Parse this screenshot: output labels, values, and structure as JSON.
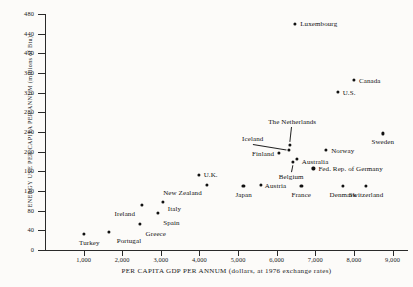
{
  "chart_data": {
    "type": "scatter",
    "title": "",
    "xlabel": "PER CAPITA GDP PER ANNUM (dollars, at 1976 exchange rates)",
    "ylabel": "ENERGY USE PER CAPITA PER ANNUM (millions of Btu)",
    "xlim": [
      0,
      9400
    ],
    "ylim": [
      0,
      480
    ],
    "xticks": [
      "1,000",
      "2,000",
      "3,000",
      "4,000",
      "5,000",
      "6,000",
      "7,000",
      "8,000",
      "9,000"
    ],
    "xtick_values": [
      1000,
      2000,
      3000,
      4000,
      5000,
      6000,
      7000,
      8000,
      9000
    ],
    "yticks": [
      "0",
      "40",
      "80",
      "120",
      "160",
      "200",
      "240",
      "280",
      "320",
      "360",
      "400",
      "440",
      "480"
    ],
    "ytick_values": [
      0,
      40,
      80,
      120,
      160,
      200,
      240,
      280,
      320,
      360,
      400,
      440,
      480
    ],
    "grid": false,
    "legend": "none",
    "points": [
      {
        "name": "Turkey",
        "x": 1000,
        "y": 33,
        "lx": 6,
        "ly": 10,
        "anchor": "center"
      },
      {
        "name": "Portugal",
        "x": 1650,
        "y": 37,
        "lx": 8,
        "ly": 10,
        "anchor": "left"
      },
      {
        "name": "Greece",
        "x": 2450,
        "y": 53,
        "lx": 6,
        "ly": 11,
        "anchor": "left"
      },
      {
        "name": "Ireland",
        "x": 2500,
        "y": 92,
        "lx": -6,
        "ly": 10,
        "anchor": "right"
      },
      {
        "name": "Spain",
        "x": 2930,
        "y": 75,
        "lx": 5,
        "ly": 11,
        "anchor": "left"
      },
      {
        "name": "Italy",
        "x": 3050,
        "y": 98,
        "lx": 5,
        "ly": 8,
        "anchor": "left"
      },
      {
        "name": "New Zealand",
        "x": 4200,
        "y": 132,
        "lx": -5,
        "ly": 9,
        "anchor": "right"
      },
      {
        "name": "U.K.",
        "x": 3980,
        "y": 152,
        "lx": 5,
        "ly": 1,
        "anchor": "left"
      },
      {
        "name": "Japan",
        "x": 5140,
        "y": 130,
        "lx": 0,
        "ly": 10,
        "anchor": "center"
      },
      {
        "name": "Austria",
        "x": 5590,
        "y": 133,
        "lx": 4,
        "ly": 2,
        "anchor": "left"
      },
      {
        "name": "Finland",
        "x": 6060,
        "y": 198,
        "lx": -5,
        "ly": 2,
        "anchor": "right"
      },
      {
        "name": "Iceland",
        "x": 6320,
        "y": 203,
        "lx": -26,
        "ly": -10,
        "anchor": "right",
        "leader": true
      },
      {
        "name": "The Netherlands",
        "x": 6350,
        "y": 213,
        "lx": 2,
        "ly": -22,
        "anchor": "center",
        "leader": true
      },
      {
        "name": "Belgium",
        "x": 6430,
        "y": 180,
        "lx": -2,
        "ly": 16,
        "anchor": "center",
        "leader": true
      },
      {
        "name": "Australia",
        "x": 6520,
        "y": 186,
        "lx": 5,
        "ly": 4,
        "anchor": "left"
      },
      {
        "name": "France",
        "x": 6640,
        "y": 130,
        "lx": 0,
        "ly": 10,
        "anchor": "center"
      },
      {
        "name": "Fed. Rep. of Germany",
        "x": 6950,
        "y": 166,
        "lx": 5,
        "ly": 2,
        "anchor": "left"
      },
      {
        "name": "Norway",
        "x": 7280,
        "y": 203,
        "lx": 5,
        "ly": 2,
        "anchor": "left"
      },
      {
        "name": "U.S.",
        "x": 7580,
        "y": 322,
        "lx": 5,
        "ly": 2,
        "anchor": "left"
      },
      {
        "name": "Denmark",
        "x": 7720,
        "y": 131,
        "lx": 0,
        "ly": 10,
        "anchor": "center"
      },
      {
        "name": "Canada",
        "x": 8000,
        "y": 346,
        "lx": 5,
        "ly": 2,
        "anchor": "left"
      },
      {
        "name": "Switzerland",
        "x": 8320,
        "y": 131,
        "lx": 0,
        "ly": 10,
        "anchor": "center"
      },
      {
        "name": "Sweden",
        "x": 8750,
        "y": 237,
        "lx": 0,
        "ly": 10,
        "anchor": "center"
      },
      {
        "name": "Luxembourg",
        "x": 6480,
        "y": 460,
        "lx": 5,
        "ly": 1,
        "anchor": "left"
      }
    ]
  }
}
